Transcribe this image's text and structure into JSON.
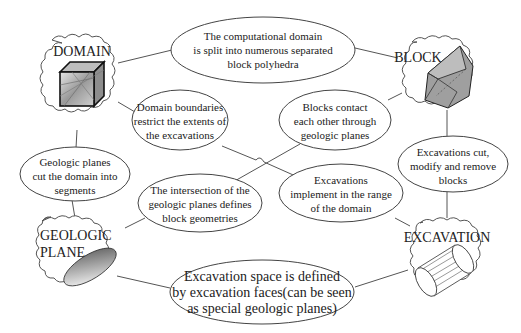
{
  "concepts": {
    "domain": {
      "label": "DOMAIN",
      "icon": "cube-icon"
    },
    "block": {
      "label": "BLOCK",
      "icon": "polyhedron-icon"
    },
    "geologic_plane": {
      "label_line1": "GEOLOGIC",
      "label_line2": "PLANE",
      "icon": "ellipse-plane-icon"
    },
    "excavation": {
      "label": "EXCAVATION",
      "icon": "cylinder-icon"
    }
  },
  "relations": {
    "domain_block": [
      "The computational domain",
      "is split into numerous separated",
      "block polyhedra"
    ],
    "domain_excavation": [
      "Domain boundaries",
      "restrict the extents of",
      "the excavations"
    ],
    "block_plane": [
      "Blocks contact",
      "each other through",
      "geologic planes"
    ],
    "plane_domain": [
      "Geologic planes",
      "cut the domain into",
      "segments"
    ],
    "plane_block": [
      "The intersection of the",
      "geologic planes defines",
      "block geometries"
    ],
    "excavation_domain": [
      "Excavations",
      "implement in the range",
      "of the domain"
    ],
    "excavation_block": [
      "Excavations cut,",
      "modify and remove",
      "blocks"
    ],
    "excavation_plane": [
      "Excavation space is defined",
      "by excavation faces(can be seen",
      "as special geologic planes)"
    ]
  }
}
